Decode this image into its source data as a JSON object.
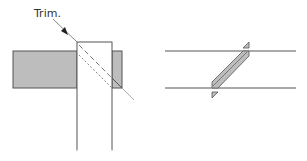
{
  "diagram": {
    "trim_label": "Trim.",
    "colors": {
      "stroke": "#555555",
      "fill_gray": "#bdbdbd",
      "fill_white": "#ffffff",
      "trim_line": "#8a8a8a",
      "text": "#333333"
    },
    "left_view": {
      "description": "Top view of horizontal board meeting vertical post with diagonal trim line",
      "horizontal_board": {
        "x": 13,
        "y": 51,
        "width": 109,
        "height": 37
      },
      "vertical_post": {
        "x": 77,
        "y": 42,
        "width": 35,
        "height": 108
      },
      "trim_line": {
        "from": [
          53,
          20
        ],
        "to": [
          134,
          101
        ]
      },
      "cut_line": {
        "from": [
          79,
          58
        ],
        "to": [
          112,
          88
        ]
      }
    },
    "right_view": {
      "description": "Two parallel lines with diagonal shaded scarf joint and section markers",
      "top_line": {
        "x1": 165,
        "x2": 296,
        "y": 51
      },
      "bottom_line": {
        "x1": 165,
        "x2": 296,
        "y": 88
      },
      "section_markers": [
        {
          "position": "top",
          "x": 245,
          "y": 44
        },
        {
          "position": "bottom",
          "x": 213,
          "y": 95
        }
      ]
    }
  }
}
